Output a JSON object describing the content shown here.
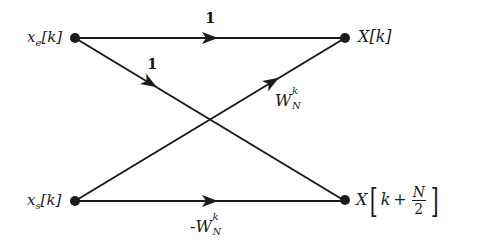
{
  "diagram": {
    "type": "butterfly-signal-flow-graph",
    "nodes": {
      "input_top": {
        "label_base": "x",
        "label_sub": "e",
        "label_arg": "[k]",
        "x": 75,
        "y": 38
      },
      "input_bottom": {
        "label_base": "x",
        "label_sub": "s",
        "label_arg": "[k]",
        "x": 75,
        "y": 201
      },
      "output_top": {
        "label": "X[k]",
        "x": 345,
        "y": 38
      },
      "output_bottom": {
        "label_base": "X",
        "label_k": "k",
        "label_plus": "+",
        "label_num": "N",
        "label_den": "2",
        "x": 345,
        "y": 201
      }
    },
    "edges": [
      {
        "from": "input_top",
        "to": "output_top",
        "gain": "1"
      },
      {
        "from": "input_top",
        "to": "output_bottom",
        "gain": "1"
      },
      {
        "from": "input_bottom",
        "to": "output_top",
        "gain_base": "W",
        "gain_sub": "N",
        "gain_sup": "k"
      },
      {
        "from": "input_bottom",
        "to": "output_bottom",
        "gain_sign": "-",
        "gain_base": "W",
        "gain_sub": "N",
        "gain_sup": "k"
      }
    ],
    "colors": {
      "line": "#1a1a1a",
      "background": "#ffffff"
    }
  }
}
